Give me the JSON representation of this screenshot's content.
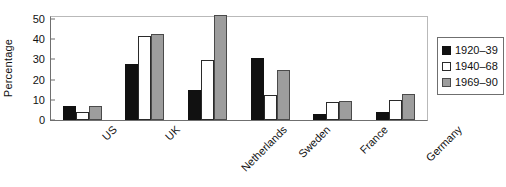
{
  "chart_data": {
    "type": "bar",
    "title": "",
    "xlabel": "",
    "ylabel": "Percentage",
    "categories": [
      "US",
      "UK",
      "Netherlands",
      "Sweden",
      "France",
      "Germany"
    ],
    "series": [
      {
        "name": "1920–39",
        "color": "#111111",
        "values": [
          7,
          27.5,
          15,
          30.5,
          3,
          4
        ]
      },
      {
        "name": "1940–68",
        "color": "#ffffff",
        "values": [
          4,
          41.5,
          29.5,
          12.5,
          9,
          10
        ]
      },
      {
        "name": "1969–90",
        "color": "#9d9d9d",
        "values": [
          7,
          42.5,
          52,
          25,
          9.5,
          13
        ]
      }
    ],
    "ylim": [
      0,
      52
    ],
    "yticks": [
      0,
      10,
      20,
      30,
      40,
      50
    ],
    "ytick_labels": [
      "0",
      "10",
      "20",
      "30",
      "40",
      "50"
    ],
    "grid": false,
    "legend_position": "right-outside",
    "legend_entries": [
      "1920–39",
      "1940–68",
      "1969–90"
    ]
  }
}
